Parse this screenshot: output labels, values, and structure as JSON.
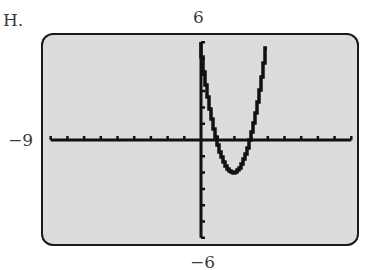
{
  "problem": {
    "label": "H."
  },
  "window": {
    "ymax_label": "6",
    "ymin_label": "−6",
    "xmin_label": "−9"
  },
  "colors": {
    "screen_bg": "#dcdcdc",
    "ink": "#111111",
    "frame": "#1a1a1a"
  },
  "chart_data": {
    "type": "line",
    "title": "",
    "xlabel": "",
    "ylabel": "",
    "xlim": [
      -9,
      9
    ],
    "ylim": [
      -6,
      6
    ],
    "xscl": 1,
    "yscl": 1,
    "grid": false,
    "tick_labels": {
      "top": "6",
      "bottom": "−6",
      "left": "−9"
    },
    "function": "y = 2x^2 - 8x + 6",
    "series": [
      {
        "name": "f(x)",
        "x": [
          0,
          0.5,
          1,
          1.5,
          2,
          2.5,
          3,
          3.5,
          4
        ],
        "y": [
          6,
          2.5,
          0,
          -1.5,
          -2,
          -1.5,
          0,
          2.5,
          6
        ]
      }
    ],
    "key_points": {
      "x_intercepts": [
        1,
        3
      ],
      "y_intercept": 6,
      "vertex": [
        2,
        -2
      ]
    }
  }
}
